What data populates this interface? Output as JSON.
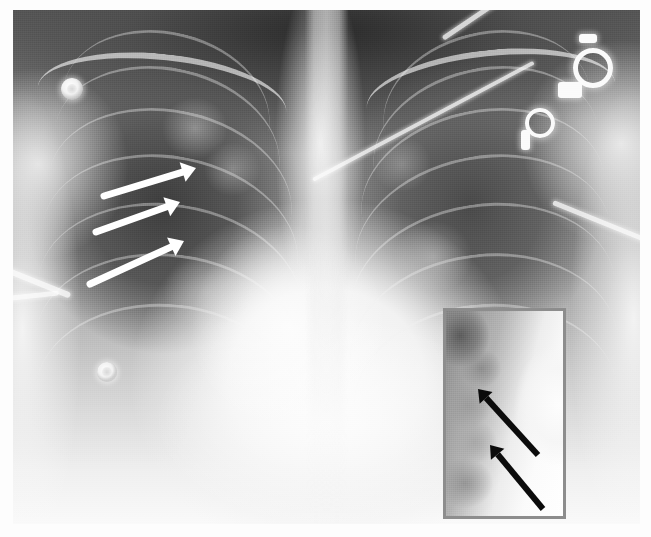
{
  "figure": {
    "kind": "chest-radiograph",
    "modality": "X-ray",
    "projection": "AP portable chest",
    "caption": "",
    "background_color": "#fdfdfd",
    "film": {
      "left": 13,
      "top": 10,
      "width": 627,
      "height": 514
    }
  },
  "annotations": {
    "main_arrows": {
      "color": "#ffffff",
      "count": 3,
      "description": "Three white arrows directed to the upper right lung zone",
      "items": [
        {
          "label": "arrow-1",
          "tail_x": 104,
          "tail_y": 196,
          "head_x": 196,
          "head_y": 168,
          "thickness": 7
        },
        {
          "label": "arrow-2",
          "tail_x": 96,
          "tail_y": 232,
          "head_x": 180,
          "head_y": 202,
          "thickness": 7
        },
        {
          "label": "arrow-3",
          "tail_x": 90,
          "tail_y": 284,
          "head_x": 184,
          "head_y": 241,
          "thickness": 7
        }
      ]
    },
    "inset_arrows": {
      "color": "#0b0b0b",
      "count": 2,
      "description": "Two black arrows directed to the upper left within the magnified inset",
      "items": [
        {
          "label": "inset-arrow-1",
          "tail_x": 92,
          "tail_y": 144,
          "head_x": 32,
          "head_y": 78,
          "thickness": 6
        },
        {
          "label": "inset-arrow-2",
          "tail_x": 97,
          "tail_y": 198,
          "head_x": 44,
          "head_y": 134,
          "thickness": 6
        }
      ]
    }
  },
  "inset": {
    "name": "magnified-detail-panel",
    "border_color": "#8d8d8d",
    "border_width": 3,
    "left": 443,
    "top": 308,
    "width": 123,
    "height": 211,
    "description": "Magnified view of the right lower lung zone / cavitary region"
  },
  "hardware": {
    "description": "Monitoring hardware projected over the chest",
    "electrodes": [
      {
        "name": "ekg-electrode-upper-left",
        "x": 61,
        "y": 80,
        "d": 22
      },
      {
        "name": "ekg-electrode-lower-left",
        "x": 96,
        "y": 363,
        "d": 20
      }
    ],
    "snaps": [
      {
        "name": "ekg-snap-upper-right",
        "x": 588,
        "y": 60,
        "d": 28
      },
      {
        "name": "ekg-snap-mid-right",
        "x": 548,
        "y": 118,
        "d": 20
      }
    ],
    "leads": [
      {
        "name": "lead-wire-right-upper",
        "x": 470,
        "y": 40,
        "w": 150,
        "h": 5,
        "rot": 34
      },
      {
        "name": "lead-wire-right-mid",
        "x": 500,
        "y": 120,
        "w": 130,
        "h": 4,
        "rot": 18
      },
      {
        "name": "lead-wire-left-edge",
        "x": 8,
        "y": 268,
        "w": 56,
        "h": 6,
        "rot": -18
      },
      {
        "name": "lead-wire-left-edge-2",
        "x": 4,
        "y": 288,
        "w": 44,
        "h": 5,
        "rot": 8
      },
      {
        "name": "lead-wire-right-lower",
        "x": 560,
        "y": 216,
        "w": 90,
        "h": 5,
        "rot": -8
      }
    ]
  },
  "anatomy": {
    "ribs_right": 7,
    "ribs_left": 7,
    "clavicles": 2,
    "notes": "Dark aerated lung fields bilaterally; bright central mediastinal and cardiac silhouette; hazy right mid-zone opacity highlighted by the arrows."
  },
  "palette": {
    "film_light": "#fbfbfb",
    "film_mid": "#9a9a9a",
    "film_dark": "#3d3d3d",
    "arrow_white": "#ffffff",
    "arrow_black": "#0b0b0b",
    "inset_border": "#8d8d8d",
    "page_background": "#fdfdfd"
  }
}
